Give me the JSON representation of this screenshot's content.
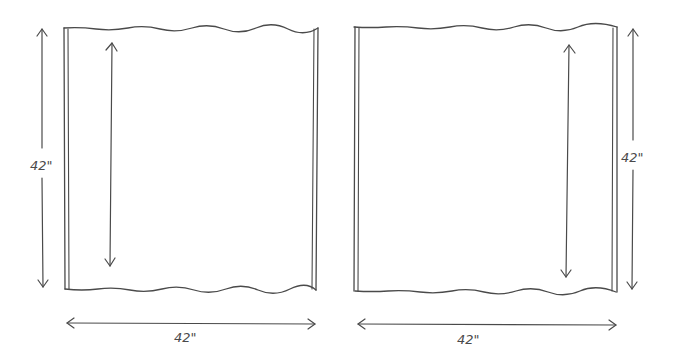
{
  "diagram": {
    "panels": [
      {
        "id": "left-panel",
        "width_label": "42\"",
        "height_label": "42\"",
        "height_label_side": "left",
        "inner_arrow_position": "left"
      },
      {
        "id": "right-panel",
        "width_label": "42\"",
        "height_label": "42\"",
        "height_label_side": "right",
        "inner_arrow_position": "right"
      }
    ],
    "ink_color": "#4a4a4a",
    "background": "#ffffff"
  }
}
